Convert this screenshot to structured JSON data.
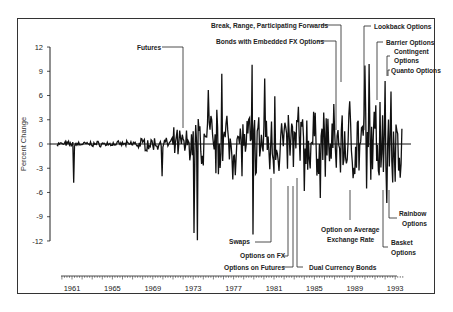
{
  "chart_data": {
    "type": "line",
    "title": "",
    "xlabel": "",
    "ylabel": "Percent Change",
    "ylim": [
      -12,
      12
    ],
    "yticks": [
      12,
      9,
      6,
      3,
      0,
      -3,
      -6,
      -9,
      -12
    ],
    "xlim": [
      1959.5,
      1994.5
    ],
    "xticks": [
      1961,
      1965,
      1969,
      1973,
      1977,
      1981,
      1985,
      1989,
      1993
    ],
    "grid": false,
    "legend": null,
    "series_description": "Monthly percent change of exchange rate; near zero until ~1971, high volatility after 1973",
    "key_points": [
      {
        "x": 1961.2,
        "y": -4.8
      },
      {
        "x": 1969.9,
        "y": -4.0
      },
      {
        "x": 1973.1,
        "y": -11.0
      },
      {
        "x": 1973.4,
        "y": -11.9
      },
      {
        "x": 1974.5,
        "y": 6.7
      },
      {
        "x": 1975.8,
        "y": 8.7
      },
      {
        "x": 1978.8,
        "y": 9.8
      },
      {
        "x": 1978.9,
        "y": -11.2
      },
      {
        "x": 1980.1,
        "y": 8.1
      },
      {
        "x": 1981.1,
        "y": 5.9
      },
      {
        "x": 1983.4,
        "y": 4.6
      },
      {
        "x": 1984.0,
        "y": -5.8
      },
      {
        "x": 1985.6,
        "y": -6.7
      },
      {
        "x": 1988.5,
        "y": 5.3
      },
      {
        "x": 1990.0,
        "y": 9.7
      },
      {
        "x": 1990.4,
        "y": 9.9
      },
      {
        "x": 1990.2,
        "y": -5.5
      },
      {
        "x": 1991.5,
        "y": 5.2
      },
      {
        "x": 1992.0,
        "y": 7.8
      },
      {
        "x": 1992.6,
        "y": 6.5
      },
      {
        "x": 1992.2,
        "y": -7.3
      }
    ],
    "annotations": [
      {
        "label": "Futures",
        "x": 1972.3
      },
      {
        "label": "Break, Range, Participating Forwards",
        "x": 1988.4
      },
      {
        "label": "Bonds with Embedded FX Options",
        "x": 1988.0
      },
      {
        "label": "Lookback Options",
        "x": 1989.8
      },
      {
        "label": "Barrier Options",
        "x": 1990.9
      },
      {
        "label": "Contingent Options",
        "x": 1991.8
      },
      {
        "label": "Quanto Options",
        "x": 1992.3
      },
      {
        "label": "Swaps",
        "x": 1980.6
      },
      {
        "label": "Options on FX",
        "x": 1982.7
      },
      {
        "label": "Options on Futures",
        "x": 1983.0
      },
      {
        "label": "Dual Currency Bonds",
        "x": 1983.7
      },
      {
        "label": "Option on Average Exchange Rate",
        "x": 1989.1
      },
      {
        "label": "Rainbow Options",
        "x": 1992.4
      },
      {
        "label": "Basket Options",
        "x": 1992.0
      }
    ]
  },
  "axis": {
    "ylabel": "Percent Change",
    "yticks": [
      "12",
      "9",
      "6",
      "3",
      "0",
      "-3",
      "-6",
      "-9",
      "-12"
    ],
    "xticks": [
      "1961",
      "1965",
      "1969",
      "1973",
      "1977",
      "1981",
      "1985",
      "1989",
      "1993"
    ]
  },
  "labels": {
    "futures": "Futures",
    "break_range": "Break, Range, Participating Forwards",
    "bonds_fx": "Bonds with Embedded FX Options",
    "lookback": "Lookback Options",
    "barrier": "Barrier Options",
    "contingent_1": "Contingent",
    "contingent_2": "Options",
    "quanto": "Quanto Options",
    "swaps": "Swaps",
    "options_fx": "Options on FX",
    "options_futures": "Options on Futures",
    "dual_currency": "Dual Currency Bonds",
    "avg_rate_1": "Option on Average",
    "avg_rate_2": "Exchange Rate",
    "rainbow_1": "Rainbow",
    "rainbow_2": "Options",
    "basket_1": "Basket",
    "basket_2": "Options"
  }
}
